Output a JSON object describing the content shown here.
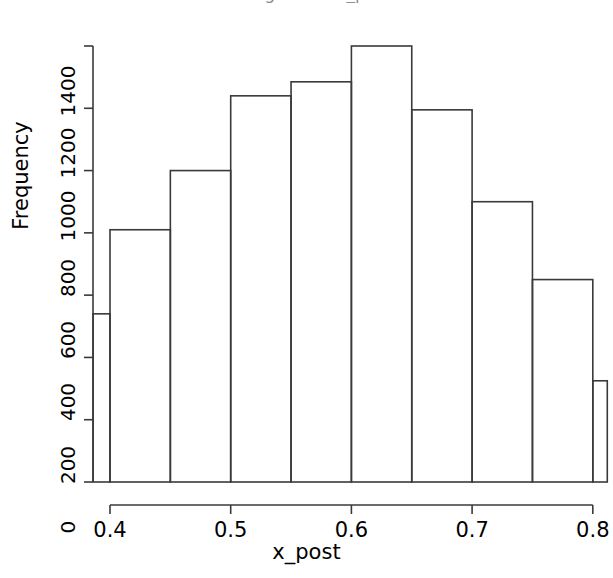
{
  "figure": {
    "width": 613,
    "height": 578,
    "background": "#ffffff",
    "line_color": "#3a3a3a",
    "text_color": "#000000",
    "title_cropped": true,
    "title_remnant": "Histogram of x_post"
  },
  "chart_data": {
    "type": "bar",
    "chart_style": "histogram",
    "title": "Histogram of x_post",
    "xlabel": "x_post",
    "ylabel": "Frequency",
    "xlim": [
      0.386,
      0.812
    ],
    "ylim": [
      0,
      1400
    ],
    "grid": false,
    "legend": null,
    "bin_width": 0.05,
    "bar_fill": "none",
    "bar_border": "#3a3a3a",
    "x_ticks": [
      0.4,
      0.5,
      0.6,
      0.7,
      0.8
    ],
    "x_tick_labels": [
      "0.4",
      "0.5",
      "0.6",
      "0.7",
      "0.8"
    ],
    "y_ticks": [
      0,
      200,
      400,
      600,
      800,
      1000,
      1200,
      1400
    ],
    "y_tick_labels": [
      "0",
      "200",
      "400",
      "600",
      "800",
      "1000",
      "1200",
      "1400"
    ],
    "bins": [
      {
        "left": 0.386,
        "right": 0.4,
        "value": 540,
        "clipped": true
      },
      {
        "left": 0.4,
        "right": 0.45,
        "value": 810,
        "clipped": false
      },
      {
        "left": 0.45,
        "right": 0.5,
        "value": 1000,
        "clipped": false
      },
      {
        "left": 0.5,
        "right": 0.55,
        "value": 1240,
        "clipped": false
      },
      {
        "left": 0.55,
        "right": 0.6,
        "value": 1285,
        "clipped": false
      },
      {
        "left": 0.6,
        "right": 0.65,
        "value": 1400,
        "clipped": false
      },
      {
        "left": 0.65,
        "right": 0.7,
        "value": 1195,
        "clipped": false
      },
      {
        "left": 0.7,
        "right": 0.75,
        "value": 900,
        "clipped": false
      },
      {
        "left": 0.75,
        "right": 0.8,
        "value": 650,
        "clipped": false
      },
      {
        "left": 0.8,
        "right": 0.812,
        "value": 325,
        "clipped": true
      }
    ],
    "categories": [
      "0.386-0.40",
      "0.40-0.45",
      "0.45-0.50",
      "0.50-0.55",
      "0.55-0.60",
      "0.60-0.65",
      "0.65-0.70",
      "0.70-0.75",
      "0.75-0.80",
      "0.80-0.812"
    ],
    "values": [
      540,
      810,
      1000,
      1240,
      1285,
      1400,
      1195,
      900,
      650,
      325
    ]
  }
}
